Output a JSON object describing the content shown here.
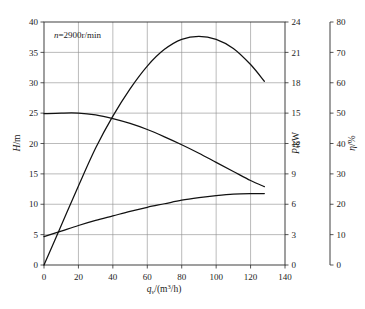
{
  "chart_data": {
    "type": "line",
    "title": "",
    "subtitle": "",
    "annotation": "n=2900r/min",
    "annotation_parts": {
      "symbol": "n",
      "equals": "=",
      "value": "2900r/min"
    },
    "xlabel": "q_v/(m³/h)",
    "xlabel_parts": {
      "base": "q",
      "sub": "v",
      "rest": "/(m",
      "sup": "3",
      "tail": "/h)"
    },
    "xlim": [
      0,
      140
    ],
    "xticks": [
      0,
      20,
      40,
      60,
      80,
      100,
      120,
      140
    ],
    "xtick_labels": [
      "0",
      "20",
      "40",
      "60",
      "80",
      "100",
      "120",
      "140"
    ],
    "grid": true,
    "legend": "none",
    "axes": [
      {
        "id": "head",
        "label": "H/m",
        "label_parts": {
          "symbol": "H",
          "unit": "/m"
        },
        "position": "left",
        "lim": [
          0,
          40
        ],
        "ticks": [
          0,
          5,
          10,
          15,
          20,
          25,
          30,
          35,
          40
        ],
        "tick_labels": [
          "0",
          "5",
          "10",
          "15",
          "20",
          "25",
          "30",
          "35",
          "40"
        ]
      },
      {
        "id": "power",
        "label": "P/kW",
        "label_parts": {
          "symbol": "P",
          "unit": "/kW"
        },
        "position": "right-inner",
        "lim": [
          0,
          24
        ],
        "ticks": [
          0,
          3,
          6,
          9,
          12,
          15,
          18,
          21,
          24
        ],
        "tick_labels": [
          "0",
          "3",
          "6",
          "9",
          "12",
          "15",
          "18",
          "21",
          "24"
        ]
      },
      {
        "id": "efficiency",
        "label": "η/%",
        "label_parts": {
          "symbol": "η",
          "unit": "/%"
        },
        "position": "right-outer",
        "lim": [
          0,
          80
        ],
        "ticks": [
          0,
          10,
          20,
          30,
          40,
          50,
          60,
          70,
          80
        ],
        "tick_labels": [
          "0",
          "10",
          "20",
          "30",
          "40",
          "50",
          "60",
          "70",
          "80"
        ]
      }
    ],
    "series": [
      {
        "name": "H",
        "axis": "head",
        "unit": "m",
        "x": [
          0,
          10,
          20,
          30,
          40,
          50,
          60,
          70,
          80,
          90,
          100,
          110,
          120,
          128
        ],
        "values": [
          24.9,
          25.0,
          25.0,
          24.7,
          24.1,
          23.3,
          22.3,
          21.1,
          19.8,
          18.4,
          16.9,
          15.4,
          13.9,
          12.9
        ]
      },
      {
        "name": "η",
        "axis": "efficiency",
        "unit": "%",
        "x": [
          0,
          10,
          20,
          30,
          40,
          50,
          60,
          70,
          80,
          90,
          100,
          110,
          120,
          128
        ],
        "values": [
          0,
          13,
          26,
          38.5,
          49,
          58,
          65.5,
          71,
          74.3,
          75.3,
          74.3,
          71.3,
          66.0,
          60.5
        ]
      },
      {
        "name": "P",
        "axis": "power",
        "unit": "kW",
        "x": [
          0,
          10,
          20,
          30,
          40,
          50,
          60,
          70,
          80,
          90,
          100,
          110,
          120,
          128
        ],
        "values": [
          2.8,
          3.35,
          3.9,
          4.4,
          4.85,
          5.3,
          5.7,
          6.05,
          6.4,
          6.65,
          6.85,
          7.0,
          7.05,
          7.05
        ]
      }
    ],
    "colors": {
      "curve": "#111111",
      "grid": "#8d8d8d",
      "axis": "#2b2b2b",
      "background": "#ffffff"
    }
  }
}
